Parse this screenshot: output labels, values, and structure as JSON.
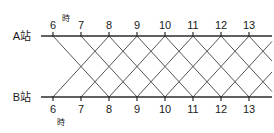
{
  "figure": {
    "kind": "train-schedule-diagram",
    "title": "",
    "background_color": "#ffffff",
    "line_color": "#555555",
    "axis_color": "#2b2b2b",
    "text_color": "#1a1a1a",
    "width": 274,
    "height": 133
  },
  "stations": {
    "top": {
      "name": "A站",
      "axis_y": 36
    },
    "bottom": {
      "name": "B站",
      "axis_y": 97
    }
  },
  "time_axis": {
    "unit_label_top": "時",
    "unit_label_bottom": "時",
    "ticks": [
      "6",
      "7",
      "8",
      "9",
      "10",
      "11",
      "12",
      "13"
    ],
    "tick_values": [
      6,
      7,
      8,
      9,
      10,
      11,
      12,
      13
    ],
    "x_start": 53,
    "x_end": 249,
    "px_per_hour": 28,
    "x_positions": [
      53,
      81,
      109,
      137,
      165,
      193,
      221,
      249
    ],
    "axis_x_left": 41,
    "axis_x_right": 272
  },
  "chart_data": {
    "type": "line",
    "title": "",
    "xlabel": "時",
    "ylabel": "",
    "x": [
      6,
      7,
      8,
      9,
      10,
      11,
      12,
      13
    ],
    "xlim": [
      5.6,
      13.8
    ],
    "grid": false,
    "legend": "none",
    "annotations": [
      {
        "text": "A站",
        "at": "top-axis-left"
      },
      {
        "text": "B站",
        "at": "bottom-axis-left"
      },
      {
        "text": "時",
        "at": "superscript-after-6-top"
      },
      {
        "text": "時",
        "at": "subscript-after-6-bottom"
      }
    ],
    "series": [
      {
        "name": "A→B 06:00",
        "direction": "down",
        "depart_hour": 6,
        "arrive_hour": 8,
        "from": "A站",
        "to": "B站"
      },
      {
        "name": "A→B 07:00",
        "direction": "down",
        "depart_hour": 7,
        "arrive_hour": 9,
        "from": "A站",
        "to": "B站"
      },
      {
        "name": "A→B 08:00",
        "direction": "down",
        "depart_hour": 8,
        "arrive_hour": 10,
        "from": "A站",
        "to": "B站"
      },
      {
        "name": "A→B 09:00",
        "direction": "down",
        "depart_hour": 9,
        "arrive_hour": 11,
        "from": "A站",
        "to": "B站"
      },
      {
        "name": "A→B 10:00",
        "direction": "down",
        "depart_hour": 10,
        "arrive_hour": 12,
        "from": "A站",
        "to": "B站"
      },
      {
        "name": "A→B 11:00",
        "direction": "down",
        "depart_hour": 11,
        "arrive_hour": 13,
        "from": "A站",
        "to": "B站"
      },
      {
        "name": "A→B 12:00",
        "direction": "down",
        "depart_hour": 12,
        "arrive_hour": 14,
        "from": "A站",
        "to": "B站"
      },
      {
        "name": "A→B 13:00",
        "direction": "down",
        "depart_hour": 13,
        "arrive_hour": 15,
        "from": "A站",
        "to": "B站"
      },
      {
        "name": "B→A 06:00",
        "direction": "up",
        "depart_hour": 6,
        "arrive_hour": 8,
        "from": "B站",
        "to": "A站"
      },
      {
        "name": "B→A 07:00",
        "direction": "up",
        "depart_hour": 7,
        "arrive_hour": 9,
        "from": "B站",
        "to": "A站"
      },
      {
        "name": "B→A 08:00",
        "direction": "up",
        "depart_hour": 8,
        "arrive_hour": 10,
        "from": "B站",
        "to": "A站"
      },
      {
        "name": "B→A 09:00",
        "direction": "up",
        "depart_hour": 9,
        "arrive_hour": 11,
        "from": "B站",
        "to": "A站"
      },
      {
        "name": "B→A 10:00",
        "direction": "up",
        "depart_hour": 10,
        "arrive_hour": 12,
        "from": "B站",
        "to": "A站"
      },
      {
        "name": "B→A 11:00",
        "direction": "up",
        "depart_hour": 11,
        "arrive_hour": 13,
        "from": "B站",
        "to": "A站"
      },
      {
        "name": "B→A 12:00",
        "direction": "up",
        "depart_hour": 12,
        "arrive_hour": 14,
        "from": "B站",
        "to": "A站"
      },
      {
        "name": "B→A 13:00",
        "direction": "up",
        "depart_hour": 13,
        "arrive_hour": 15,
        "from": "B站",
        "to": "A站"
      }
    ]
  }
}
